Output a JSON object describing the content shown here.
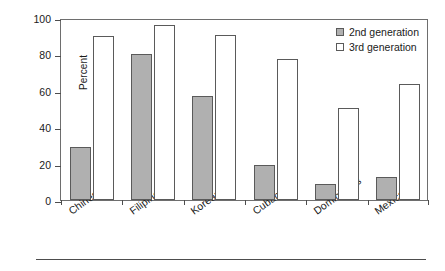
{
  "chart_data": {
    "type": "bar",
    "title": "",
    "subtitle": "",
    "xlabel": "",
    "ylabel": "Percent",
    "ylim": [
      0,
      100
    ],
    "yticks": [
      0,
      20,
      40,
      60,
      80,
      100
    ],
    "grid": false,
    "legend_position": "top-right",
    "categories": [
      "Chinese",
      "Filipinos",
      "Koreans",
      "Cubans",
      "Dominicans",
      "Mexicans"
    ],
    "series": [
      {
        "name": "2nd generation",
        "color": "#b0b0b0",
        "values": [
          29,
          80,
          57,
          19,
          9,
          12.5
        ]
      },
      {
        "name": "3rd generation",
        "color": "#ffffff",
        "values": [
          90,
          96,
          90.5,
          77.5,
          50.5,
          63.5
        ]
      }
    ]
  },
  "legend": {
    "items": [
      {
        "label": "2nd generation",
        "swatch": "filled-gray-square"
      },
      {
        "label": "3rd generation",
        "swatch": "empty-white-square"
      }
    ]
  },
  "axes": {
    "y_label": "Percent",
    "y_tick_labels": [
      "100",
      "80",
      "60",
      "40",
      "20",
      "0"
    ],
    "x_tick_labels": [
      "Chinese",
      "Filipinos",
      "Koreans",
      "Cubans",
      "Dominicans",
      "Mexicans"
    ]
  }
}
